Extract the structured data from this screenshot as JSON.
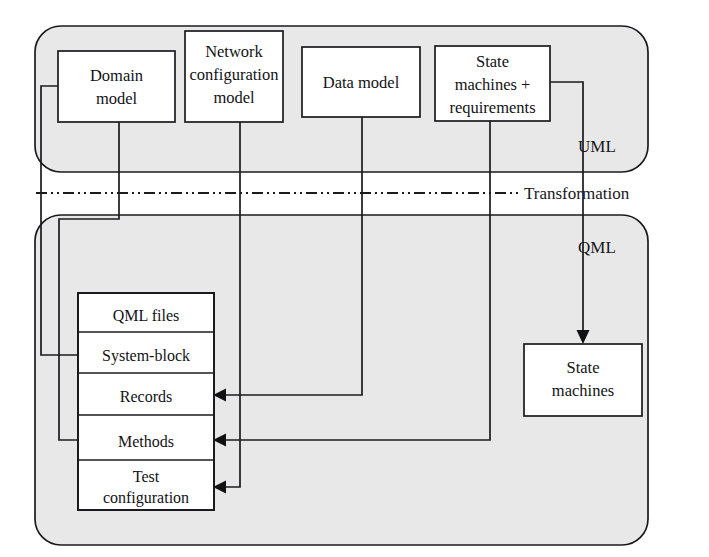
{
  "diagram": {
    "colors": {
      "lane_fill": "#e8e8e8",
      "node_fill": "#ffffff",
      "stroke": "#1b1b1f",
      "background": "#ffffff"
    },
    "lanes": [
      {
        "id": "uml",
        "label": "UML"
      },
      {
        "id": "qml",
        "label": "QML"
      }
    ],
    "separator": {
      "label": "Transformation"
    },
    "uml_nodes": [
      {
        "id": "domain-model",
        "lines": [
          "Domain",
          "model"
        ]
      },
      {
        "id": "network-configuration-model",
        "lines": [
          "Network",
          "configuration",
          "model"
        ]
      },
      {
        "id": "data-model",
        "lines": [
          "Data model"
        ]
      },
      {
        "id": "state-machines-requirements",
        "lines": [
          "State",
          "machines +",
          "requirements"
        ]
      }
    ],
    "qml_stack": {
      "id": "qml-artifacts-stack",
      "rows": [
        {
          "id": "qml-files",
          "lines": [
            "QML files"
          ]
        },
        {
          "id": "system-block",
          "lines": [
            "System-block"
          ]
        },
        {
          "id": "records",
          "lines": [
            "Records"
          ]
        },
        {
          "id": "methods",
          "lines": [
            "Methods"
          ]
        },
        {
          "id": "test-configuration",
          "lines": [
            "Test",
            "configuration"
          ]
        }
      ]
    },
    "qml_nodes": [
      {
        "id": "state-machines",
        "lines": [
          "State",
          "machines"
        ]
      }
    ],
    "connections": [
      {
        "id": "domain-model-to-system-block",
        "from": "domain-model",
        "to": "system-block"
      },
      {
        "id": "domain-model-to-methods",
        "from": "domain-model",
        "to": "methods"
      },
      {
        "id": "network-configuration-model-to-test-configuration",
        "from": "network-configuration-model",
        "to": "test-configuration"
      },
      {
        "id": "data-model-to-records",
        "from": "data-model",
        "to": "records"
      },
      {
        "id": "state-machines-requirements-to-methods",
        "from": "state-machines-requirements",
        "to": "methods"
      },
      {
        "id": "state-machines-requirements-to-state-machines",
        "from": "state-machines-requirements",
        "to": "state-machines"
      }
    ]
  }
}
